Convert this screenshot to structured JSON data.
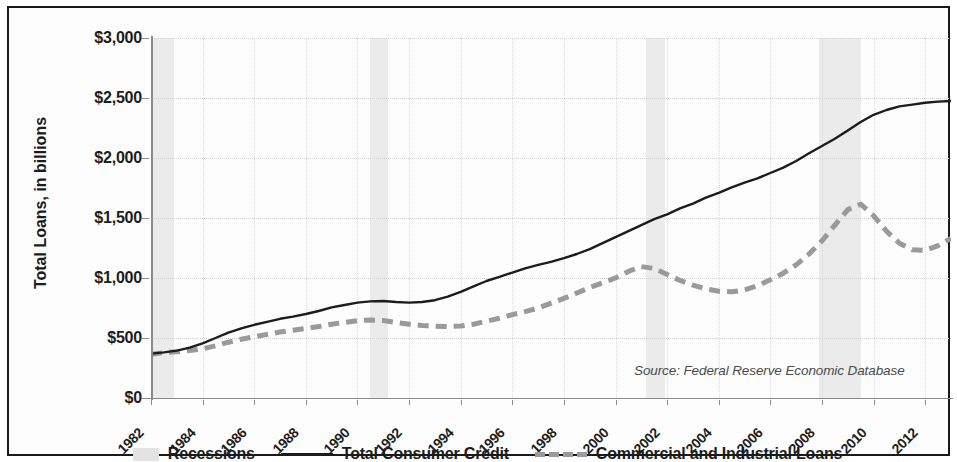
{
  "figure": {
    "source_note": "Source: Federal Reserve Economic Database",
    "axis_title_y": "Total Loans, in billions"
  },
  "legend": {
    "items": [
      {
        "label": "Recessions",
        "marker": "shaded-band-swatch"
      },
      {
        "label": "Total Consumer Credit",
        "marker": "solid-line-swatch"
      },
      {
        "label": "Commercial and Industrial Loans",
        "marker": "dashed-line-swatch"
      }
    ]
  },
  "chart_data": {
    "type": "line",
    "title": "",
    "xlabel": "",
    "ylabel": "Total Loans, in billions",
    "xlim": [
      1982,
      2013
    ],
    "ylim": [
      0,
      3000
    ],
    "grid": true,
    "legend_position": "bottom",
    "ytick_labels": [
      "$3,000",
      "$2,500",
      "$2,000",
      "$1,500",
      "$1,000",
      "$500",
      "$0"
    ],
    "ytick_values": [
      3000,
      2500,
      2000,
      1500,
      1000,
      500,
      0
    ],
    "xtick_labels": [
      "1982",
      "1984",
      "1986",
      "1988",
      "1990",
      "1992",
      "1994",
      "1996",
      "1998",
      "2000",
      "2002",
      "2004",
      "2006",
      "2008",
      "2010",
      "2012"
    ],
    "xtick_values": [
      1982,
      1984,
      1986,
      1988,
      1990,
      1992,
      1994,
      1996,
      1998,
      2000,
      2002,
      2004,
      2006,
      2008,
      2010,
      2012
    ],
    "annotations": [
      {
        "text": "Source: Federal Reserve Economic Database",
        "x": 2006.2,
        "y": 160
      }
    ],
    "shaded_regions": [
      {
        "name": "Recessions",
        "label": "1981-82 recession",
        "x_start": 1982.0,
        "x_end": 1982.9,
        "color": "#ebebeb"
      },
      {
        "name": "Recessions",
        "label": "1990-91 recession",
        "x_start": 1990.5,
        "x_end": 1991.2,
        "color": "#ebebeb"
      },
      {
        "name": "Recessions",
        "label": "2001 recession",
        "x_start": 2001.2,
        "x_end": 2001.9,
        "color": "#ebebeb"
      },
      {
        "name": "Recessions",
        "label": "2007-09 recession",
        "x_start": 2007.9,
        "x_end": 2009.5,
        "color": "#ebebeb"
      }
    ],
    "x": [
      1982,
      1982.5,
      1983,
      1983.5,
      1984,
      1984.5,
      1985,
      1985.5,
      1986,
      1986.5,
      1987,
      1987.5,
      1988,
      1988.5,
      1989,
      1989.5,
      1990,
      1990.5,
      1991,
      1991.5,
      1992,
      1992.5,
      1993,
      1993.5,
      1994,
      1994.5,
      1995,
      1995.5,
      1996,
      1996.5,
      1997,
      1997.5,
      1998,
      1998.5,
      1999,
      1999.5,
      2000,
      2000.5,
      2001,
      2001.5,
      2002,
      2002.5,
      2003,
      2003.5,
      2004,
      2004.5,
      2005,
      2005.5,
      2006,
      2006.5,
      2007,
      2007.5,
      2008,
      2008.5,
      2009,
      2009.5,
      2010,
      2010.5,
      2011,
      2011.5,
      2012,
      2012.5,
      2013
    ],
    "series": [
      {
        "name": "Total Consumer Credit",
        "style": "solid",
        "color": "#1c1c1c",
        "values": [
          370,
          380,
          395,
          420,
          455,
          500,
          545,
          580,
          610,
          635,
          660,
          678,
          700,
          725,
          755,
          775,
          795,
          805,
          808,
          800,
          795,
          800,
          815,
          845,
          885,
          930,
          975,
          1010,
          1045,
          1080,
          1110,
          1135,
          1165,
          1200,
          1240,
          1290,
          1340,
          1390,
          1440,
          1490,
          1530,
          1580,
          1620,
          1670,
          1710,
          1755,
          1795,
          1830,
          1875,
          1920,
          1975,
          2040,
          2100,
          2160,
          2230,
          2300,
          2360,
          2400,
          2430,
          2445,
          2460,
          2470,
          2475
        ]
      },
      {
        "name": "Commercial and Industrial Loans",
        "style": "dashed",
        "color": "#9a9a9a",
        "values": [
          365,
          378,
          385,
          395,
          410,
          435,
          465,
          490,
          510,
          530,
          550,
          565,
          580,
          595,
          615,
          630,
          645,
          650,
          645,
          630,
          615,
          605,
          598,
          595,
          600,
          615,
          640,
          665,
          695,
          720,
          750,
          790,
          830,
          875,
          920,
          960,
          1000,
          1055,
          1095,
          1080,
          1030,
          980,
          940,
          910,
          890,
          885,
          900,
          935,
          985,
          1040,
          1110,
          1200,
          1310,
          1440,
          1570,
          1615,
          1520,
          1390,
          1290,
          1235,
          1230,
          1270,
          1330
        ]
      }
    ]
  }
}
